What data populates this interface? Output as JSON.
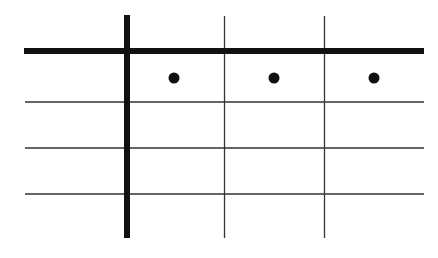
{
  "diagram": {
    "type": "grid-table",
    "background": "#ffffff",
    "line_color": "#222222",
    "thick_line_color": "#111111",
    "dot_color": "#111111",
    "columns": 4,
    "rows": 4,
    "header_row_dots": [
      {
        "column": 2,
        "cx": 174,
        "cy": 78
      },
      {
        "column": 3,
        "cx": 274,
        "cy": 78
      },
      {
        "column": 4,
        "cx": 374,
        "cy": 78
      }
    ],
    "cells_text": []
  }
}
